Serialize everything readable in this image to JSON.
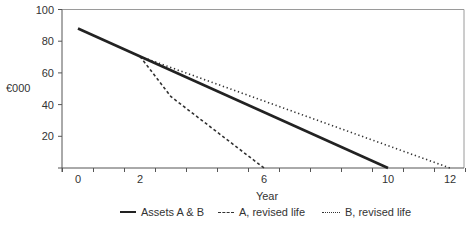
{
  "chart_data": {
    "type": "line",
    "title": "",
    "xlabel": "Year",
    "ylabel": "€000",
    "x_tick_labels": [
      {
        "x": 0,
        "label": "0"
      },
      {
        "x": 2,
        "label": "2"
      },
      {
        "x": 6,
        "label": "6"
      },
      {
        "x": 10,
        "label": "10"
      },
      {
        "x": 12,
        "label": "12"
      }
    ],
    "y_tick_labels": [
      {
        "y": 20,
        "label": "20"
      },
      {
        "y": 40,
        "label": "40"
      },
      {
        "y": 60,
        "label": "60"
      },
      {
        "y": 80,
        "label": "80"
      },
      {
        "y": 100,
        "label": "100"
      }
    ],
    "xlim": [
      -0.5,
      12.5
    ],
    "ylim": [
      0,
      100
    ],
    "grid": false,
    "legend_position": "bottom",
    "series": [
      {
        "name": "Assets A & B",
        "style": "solid",
        "color": "#222222",
        "points": [
          [
            0,
            88
          ],
          [
            10,
            0
          ]
        ]
      },
      {
        "name": "A, revised life",
        "style": "dashed",
        "color": "#333333",
        "points": [
          [
            2,
            70.4
          ],
          [
            3,
            45
          ],
          [
            6,
            0
          ]
        ]
      },
      {
        "name": "B, revised life",
        "style": "dotted",
        "color": "#333333",
        "points": [
          [
            2,
            70.4
          ],
          [
            12,
            0
          ]
        ]
      }
    ]
  },
  "legend": {
    "items": [
      {
        "label": "Assets A & B"
      },
      {
        "label": "A, revised life"
      },
      {
        "label": "B, revised life"
      }
    ]
  }
}
